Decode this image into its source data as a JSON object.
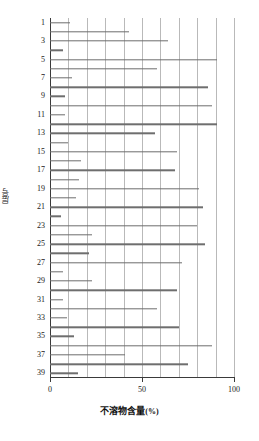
{
  "chart_data": {
    "type": "bar",
    "orientation": "horizontal",
    "title": "",
    "xlabel": "不溶物含量(%)",
    "ylabel": "层号",
    "xlim": [
      0,
      100
    ],
    "xticks": [
      0,
      50,
      100
    ],
    "xtick_labels": [
      "0",
      "50",
      "100"
    ],
    "grid": "vertical-major-every-10",
    "gridlines_x": [
      10,
      20,
      30,
      40,
      50,
      60,
      70,
      80,
      90,
      100
    ],
    "legend": "none",
    "categories": [
      1,
      2,
      3,
      4,
      5,
      6,
      7,
      8,
      9,
      10,
      11,
      12,
      13,
      14,
      15,
      16,
      17,
      18,
      19,
      20,
      21,
      22,
      23,
      24,
      25,
      26,
      27,
      28,
      29,
      30,
      31,
      32,
      33,
      34,
      35,
      36,
      37,
      38,
      39
    ],
    "ytick_labels": [
      "1",
      "3",
      "5",
      "7",
      "9",
      "11",
      "13",
      "15",
      "17",
      "19",
      "21",
      "23",
      "25",
      "27",
      "29",
      "31",
      "33",
      "35",
      "37",
      "39"
    ],
    "ytick_values": [
      1,
      3,
      5,
      7,
      9,
      11,
      13,
      15,
      17,
      19,
      21,
      23,
      25,
      27,
      29,
      31,
      33,
      35,
      37,
      39
    ],
    "values": [
      11,
      43,
      64,
      7,
      91,
      58,
      12,
      86,
      8,
      88,
      8,
      91,
      57,
      10,
      69,
      17,
      68,
      16,
      81,
      14,
      83,
      6,
      80,
      23,
      84,
      21,
      72,
      7,
      23,
      69,
      7,
      58,
      9,
      70,
      13,
      88,
      41,
      75,
      15
    ],
    "series": [
      {
        "name": "不溶物含量",
        "color": "#6e6e6e",
        "values": [
          11,
          43,
          64,
          7,
          91,
          58,
          12,
          86,
          8,
          88,
          8,
          91,
          57,
          10,
          69,
          17,
          68,
          16,
          81,
          14,
          83,
          6,
          80,
          23,
          84,
          21,
          72,
          7,
          23,
          69,
          7,
          58,
          9,
          70,
          13,
          88,
          41,
          75,
          15
        ]
      }
    ]
  },
  "axes": {
    "x_title_main": "不溶物含量",
    "x_title_unit": "(%)",
    "y_title": "层号"
  },
  "colors": {
    "bar": "#6e6e6e",
    "axis": "#3a3a3a",
    "grid": "#b9b9b9",
    "background": "#ffffff",
    "text": "#1a1a1a"
  }
}
